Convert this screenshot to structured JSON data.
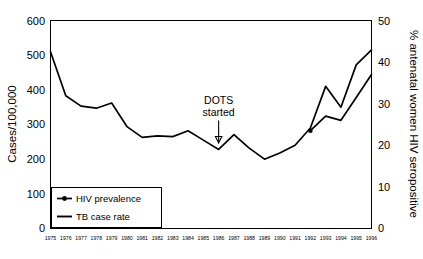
{
  "chart_data": {
    "type": "line",
    "title": "",
    "xlabel": "",
    "ylabel": "Cases/100,000",
    "y2label": "% antenatal women HIV seropositive",
    "grid": false,
    "legend_position": "bottom-left",
    "ylim": [
      0,
      600
    ],
    "y2lim": [
      0,
      50
    ],
    "yticks": [
      "0",
      "100",
      "200",
      "300",
      "400",
      "500",
      "600"
    ],
    "y2ticks": [
      "0",
      "10",
      "20",
      "30",
      "40",
      "50"
    ],
    "categories": [
      "1975",
      "1976",
      "1977",
      "1978",
      "1979",
      "1980",
      "1981",
      "1982",
      "1983",
      "1984",
      "1985",
      "1986",
      "1987",
      "1988",
      "1989",
      "1990",
      "1991",
      "1992",
      "1993",
      "1994",
      "1995",
      "1996"
    ],
    "series": [
      {
        "name": "TB case rate",
        "axis": "left",
        "units": "Cases/100,000",
        "values": [
          510,
          383,
          353,
          347,
          362,
          294,
          263,
          267,
          265,
          282,
          255,
          228,
          271,
          232,
          200,
          218,
          240,
          290,
          410,
          350,
          472,
          515
        ]
      },
      {
        "name": "HIV prevalence",
        "axis": "right",
        "units": "% antenatal women HIV seropositive",
        "values": [
          null,
          null,
          null,
          null,
          null,
          null,
          null,
          null,
          null,
          null,
          null,
          null,
          null,
          null,
          null,
          null,
          null,
          23.5,
          27.0,
          26.0,
          31.5,
          37.0
        ]
      }
    ],
    "annotations": [
      {
        "name": "dots-started",
        "text_line1": "DOTS",
        "text_line2": "started",
        "points_to_category": "1986",
        "arrow": "down"
      }
    ],
    "legend": [
      {
        "label": "HIV prevalence",
        "marker": "line-with-point"
      },
      {
        "label": "TB case rate",
        "marker": "line"
      }
    ],
    "colors": {
      "line": "#000000",
      "frame": "#000000",
      "background": "#ffffff"
    }
  }
}
